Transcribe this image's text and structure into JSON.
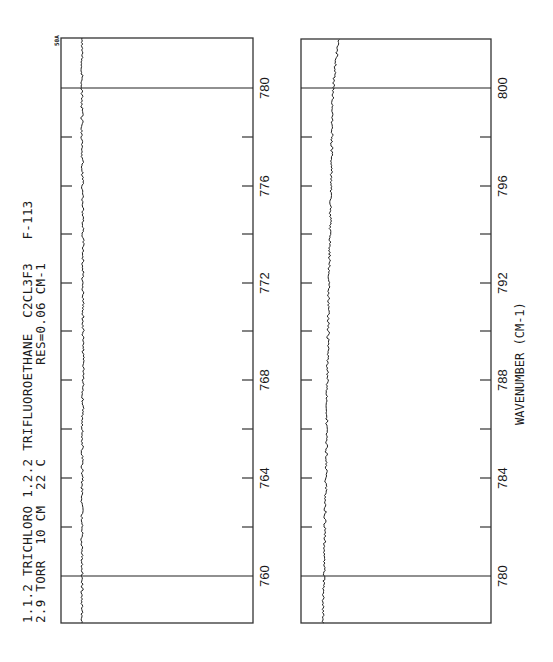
{
  "title": {
    "line1": "1.1.2 TRICHLORO 1.2.2 TRIFLUOROETHANE  C2CL3F3   F-113",
    "line2": "2.9 TORR  10 CM  22 C            RES=0.06 CM-1"
  },
  "tag": "50A",
  "xaxis_label": "WAVENUMBER (CM-1)",
  "chart_data": {
    "type": "line",
    "title": "1.1.2 TRICHLORO 1.2.2 TRIFLUOROETHANE C2CL3F3 F-113",
    "subtitle": "2.9 TORR 10 CM 22 C RES=0.06 CM-1",
    "xlabel": "WAVENUMBER (CM-1)",
    "ylabel": "",
    "orientation": "rotated 90 degrees counter-clockwise (wavenumber axis vertical, increasing upward)",
    "grid": false,
    "panels": [
      {
        "name": "left-panel",
        "xlim": [
          758.5,
          781
        ],
        "major_ticks": [
          760,
          764,
          768,
          772,
          776,
          780
        ],
        "minor_ticks": [
          762,
          766,
          770,
          774,
          778
        ],
        "reference_lines": [
          760,
          780
        ],
        "series": [
          {
            "name": "transmittance",
            "x": [
              758.5,
              760,
              764,
              768,
              772,
              776,
              780,
              781
            ],
            "y": [
              0.12,
              0.12,
              0.12,
              0.12,
              0.12,
              0.12,
              0.12,
              0.12
            ],
            "note": "flat noisy baseline, no absorption features"
          }
        ]
      },
      {
        "name": "right-panel",
        "xlim": [
          778.5,
          801
        ],
        "major_ticks": [
          780,
          784,
          788,
          792,
          796,
          800
        ],
        "minor_ticks": [
          782,
          786,
          790,
          794,
          798
        ],
        "reference_lines": [
          780,
          800
        ],
        "series": [
          {
            "name": "transmittance",
            "x": [
              778.5,
              780,
              784,
              788,
              792,
              796,
              800,
              801
            ],
            "y": [
              0.12,
              0.12,
              0.13,
              0.14,
              0.15,
              0.16,
              0.17,
              0.2
            ],
            "note": "noisy baseline drifting slightly upward with wavenumber"
          }
        ]
      }
    ]
  },
  "panels": [
    {
      "left": 61,
      "right": 253,
      "top": 38,
      "bottom": 623,
      "labels": [
        "760",
        "764",
        "768",
        "772",
        "776",
        "780"
      ],
      "label_y": [
        576,
        478,
        380,
        283,
        186,
        88
      ],
      "ref_y": [
        576,
        88
      ],
      "tick_y": [
        527,
        478,
        429,
        380,
        331,
        283,
        234,
        186,
        137
      ],
      "trace": [
        [
          82,
          623
        ],
        [
          82,
          500
        ],
        [
          83,
          380
        ],
        [
          83,
          250
        ],
        [
          82,
          120
        ],
        [
          82,
          38
        ]
      ]
    },
    {
      "left": 301,
      "right": 491,
      "top": 39,
      "bottom": 623,
      "labels": [
        "780",
        "784",
        "788",
        "792",
        "796",
        "800"
      ],
      "label_y": [
        576,
        478,
        380,
        283,
        186,
        88
      ],
      "ref_y": [
        576,
        88
      ],
      "tick_y": [
        527,
        478,
        429,
        380,
        331,
        283,
        234,
        186,
        137
      ],
      "trace": [
        [
          323,
          623
        ],
        [
          324,
          575
        ],
        [
          326,
          478
        ],
        [
          327,
          400
        ],
        [
          329,
          283
        ],
        [
          331,
          186
        ],
        [
          333,
          88
        ],
        [
          336,
          60
        ],
        [
          339,
          39
        ]
      ]
    }
  ]
}
